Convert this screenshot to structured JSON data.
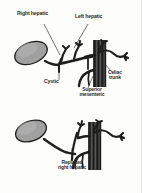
{
  "figure": {
    "background_color": "#fdfdfc",
    "ink_color": "#222222",
    "organ_fill_color": "#9b9b9b",
    "vessel_fill_color": "#2a2a2a",
    "aorta_fill_color": "#4a4a4a"
  },
  "panels": [
    {
      "id": "normal-anatomy",
      "caption": "Normal hepatic arterial anatomy",
      "labels": [
        {
          "id": "right-hepatic",
          "text": "Right hepatic"
        },
        {
          "id": "left-hepatic",
          "text": "Left hepatic"
        },
        {
          "id": "cystic",
          "text": "Cystic"
        },
        {
          "id": "celiac-trunk",
          "text": "Celiac\ntrunk"
        },
        {
          "id": "superior-mesenteric",
          "text": "Superior\nmesenteric"
        }
      ],
      "structures": [
        {
          "id": "gallbladder",
          "name": "gallbladder"
        },
        {
          "id": "cystic-duct",
          "name": "cystic duct"
        },
        {
          "id": "aorta",
          "name": "aorta"
        },
        {
          "id": "celiac-axis",
          "name": "celiac axis"
        },
        {
          "id": "common-hepatic-artery",
          "name": "common hepatic artery"
        },
        {
          "id": "superior-mesenteric-artery",
          "name": "superior mesenteric artery"
        }
      ]
    },
    {
      "id": "replaced-right-hepatic",
      "caption": "Replaced right hepatic artery variant",
      "labels": [
        {
          "id": "replaced-right-hepatic",
          "text": "Replaced\nright hepatic"
        }
      ],
      "structures": [
        {
          "id": "gallbladder",
          "name": "gallbladder"
        },
        {
          "id": "aorta",
          "name": "aorta"
        },
        {
          "id": "celiac-axis",
          "name": "celiac axis"
        },
        {
          "id": "superior-mesenteric-artery",
          "name": "superior mesenteric artery"
        },
        {
          "id": "replaced-right-hepatic-artery",
          "name": "replaced right hepatic artery"
        }
      ]
    }
  ]
}
